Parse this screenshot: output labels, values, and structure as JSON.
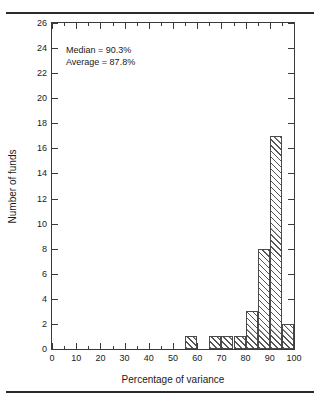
{
  "chart_data": {
    "type": "bar",
    "title": "",
    "subtitle": "",
    "xlabel": "Percentage of variance",
    "ylabel": "Number of funds",
    "xlim": [
      0,
      100
    ],
    "ylim": [
      0,
      26
    ],
    "grid": false,
    "legend": null,
    "bin_width": 5,
    "x_ticks": [
      0,
      10,
      20,
      30,
      40,
      50,
      60,
      70,
      80,
      90,
      100
    ],
    "x_tick_labels": [
      "0",
      "10",
      "20",
      "30",
      "40",
      "50",
      "60",
      "70",
      "80",
      "90",
      "100"
    ],
    "x_minor_ticks": [
      5,
      15,
      25,
      35,
      45,
      55,
      65,
      75,
      85,
      95
    ],
    "y_ticks": [
      0,
      2,
      4,
      6,
      8,
      10,
      12,
      14,
      16,
      18,
      20,
      22,
      24,
      26
    ],
    "y_tick_labels": [
      "0",
      "2",
      "4",
      "6",
      "8",
      "10",
      "12",
      "14",
      "16",
      "18",
      "20",
      "22",
      "24",
      "26"
    ],
    "bins": [
      {
        "start": 0,
        "end": 5,
        "value": 0
      },
      {
        "start": 5,
        "end": 10,
        "value": 0
      },
      {
        "start": 10,
        "end": 15,
        "value": 0
      },
      {
        "start": 15,
        "end": 20,
        "value": 0
      },
      {
        "start": 20,
        "end": 25,
        "value": 0
      },
      {
        "start": 25,
        "end": 30,
        "value": 0
      },
      {
        "start": 30,
        "end": 35,
        "value": 0
      },
      {
        "start": 35,
        "end": 40,
        "value": 0
      },
      {
        "start": 40,
        "end": 45,
        "value": 0
      },
      {
        "start": 45,
        "end": 50,
        "value": 0
      },
      {
        "start": 50,
        "end": 55,
        "value": 0
      },
      {
        "start": 55,
        "end": 60,
        "value": 1
      },
      {
        "start": 60,
        "end": 65,
        "value": 0
      },
      {
        "start": 65,
        "end": 70,
        "value": 1
      },
      {
        "start": 70,
        "end": 75,
        "value": 1
      },
      {
        "start": 75,
        "end": 80,
        "value": 1
      },
      {
        "start": 80,
        "end": 85,
        "value": 3
      },
      {
        "start": 85,
        "end": 90,
        "value": 8
      },
      {
        "start": 90,
        "end": 95,
        "value": 17
      },
      {
        "start": 95,
        "end": 100,
        "value": 2
      }
    ],
    "categories": [
      "55-60",
      "65-70",
      "70-75",
      "75-80",
      "80-85",
      "85-90",
      "90-95",
      "95-100"
    ],
    "values": [
      1,
      1,
      1,
      1,
      3,
      8,
      17,
      2
    ],
    "annotations": [
      {
        "id": "median",
        "text": "Median = 90.3%"
      },
      {
        "id": "average",
        "text": "Average = 87.8%"
      }
    ],
    "style": {
      "bar_fill": "#ffffff",
      "bar_hatch": "forward-diagonal",
      "bar_edge": "#4a4a4a",
      "axis_color": "#3a3a3a",
      "text_color": "#1a1a1a",
      "background": "#ffffff"
    }
  }
}
